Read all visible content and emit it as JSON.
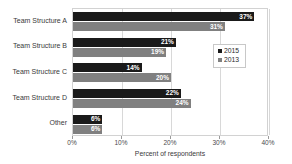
{
  "chart_data": {
    "type": "bar",
    "orientation": "horizontal",
    "title": "",
    "xlabel": "Percent of respondents",
    "ylabel": "",
    "xlim": [
      0,
      40
    ],
    "xticks": [
      "0%",
      "10%",
      "20%",
      "30%",
      "40%"
    ],
    "xtick_values": [
      0,
      10,
      20,
      30,
      40
    ],
    "grid": true,
    "grid_axis": "x",
    "legend_position": "center-right",
    "categories": [
      "Team Structure A",
      "Team Structure B",
      "Team Structure C",
      "Team Structure D",
      "Other"
    ],
    "series": [
      {
        "name": "2015",
        "color": "#1a1a1a",
        "values": [
          37,
          21,
          14,
          22,
          6
        ],
        "labels": [
          "37%",
          "21%",
          "14%",
          "22%",
          "6%"
        ]
      },
      {
        "name": "2013",
        "color": "#808080",
        "values": [
          31,
          19,
          20,
          24,
          6
        ],
        "labels": [
          "31%",
          "19%",
          "20%",
          "24%",
          "6%"
        ]
      }
    ]
  }
}
